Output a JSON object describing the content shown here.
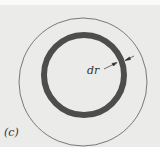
{
  "figure": {
    "label": "(c)",
    "dimension_label": "dr",
    "colors": {
      "background": "#ebebea",
      "outer_circle": "#555555",
      "ring": "#4d4d4d"
    },
    "shapes": {
      "outer_circle": {
        "cx": 83,
        "cy": 82,
        "r": 64
      },
      "ring": {
        "cx": 84,
        "cy": 75,
        "r": 40,
        "thickness": 6
      }
    }
  }
}
